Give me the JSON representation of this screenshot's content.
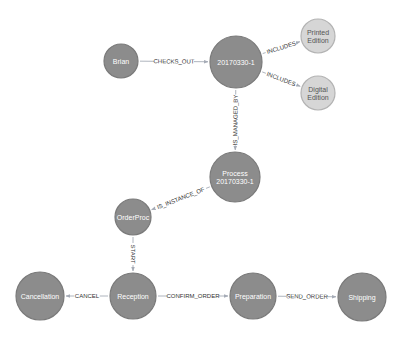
{
  "graph": {
    "colors": {
      "node_dark_fill": "#8c8c8c",
      "node_dark_stroke": "#7a7a7a",
      "node_light_fill": "#d6d6d6",
      "node_light_stroke": "#b3b3b3",
      "node_dark_text": "#ffffff",
      "node_light_text": "#555555",
      "edge": "#a5abb6"
    },
    "nodes": [
      {
        "id": "brian",
        "label": [
          "Brian"
        ],
        "x": 121,
        "y": 61,
        "r": 17,
        "style": "dark"
      },
      {
        "id": "order",
        "label": [
          "20170330-1"
        ],
        "x": 236,
        "y": 62,
        "r": 26,
        "style": "dark"
      },
      {
        "id": "printed",
        "label": [
          "Printed",
          "Edition"
        ],
        "x": 318,
        "y": 36,
        "r": 17,
        "style": "light"
      },
      {
        "id": "digital",
        "label": [
          "Digital",
          "Edition"
        ],
        "x": 318,
        "y": 93,
        "r": 17,
        "style": "light"
      },
      {
        "id": "process",
        "label": [
          "Process",
          "20170330-1"
        ],
        "x": 235,
        "y": 177,
        "r": 25,
        "style": "dark"
      },
      {
        "id": "orderproc",
        "label": [
          "OrderProc"
        ],
        "x": 133,
        "y": 217,
        "r": 18,
        "style": "dark"
      },
      {
        "id": "cancellation",
        "label": [
          "Cancellation"
        ],
        "x": 40,
        "y": 296,
        "r": 24,
        "style": "dark"
      },
      {
        "id": "reception",
        "label": [
          "Reception"
        ],
        "x": 133,
        "y": 296,
        "r": 23,
        "style": "dark"
      },
      {
        "id": "preparation",
        "label": [
          "Preparation"
        ],
        "x": 253,
        "y": 296,
        "r": 23,
        "style": "dark"
      },
      {
        "id": "shipping",
        "label": [
          "Shipping"
        ],
        "x": 362,
        "y": 297,
        "r": 24,
        "style": "dark"
      }
    ],
    "edges": [
      {
        "from": "brian",
        "to": "order",
        "label": "CHECKS_OUT"
      },
      {
        "from": "order",
        "to": "printed",
        "label": "INCLUDES"
      },
      {
        "from": "order",
        "to": "digital",
        "label": "INCLUDES"
      },
      {
        "from": "order",
        "to": "process",
        "label": "IS_MANAGED_BY"
      },
      {
        "from": "process",
        "to": "orderproc",
        "label": "IS_INSTANCE_OF"
      },
      {
        "from": "orderproc",
        "to": "reception",
        "label": "START"
      },
      {
        "from": "reception",
        "to": "cancellation",
        "label": "CANCEL"
      },
      {
        "from": "reception",
        "to": "preparation",
        "label": "CONFIRM_ORDER"
      },
      {
        "from": "preparation",
        "to": "shipping",
        "label": "SEND_ORDER"
      }
    ]
  }
}
